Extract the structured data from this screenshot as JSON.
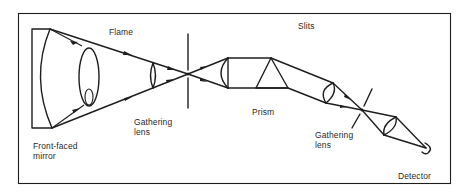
{
  "diagram": {
    "labels": {
      "flame": "Flame",
      "slits": "Slits",
      "gathering_lens_1": "Gathering\nlens",
      "prism": "Prism",
      "gathering_lens_2": "Gathering\nlens",
      "front_faced_mirror": "Front-faced\nmirror",
      "detector": "Detector"
    },
    "components": [
      "front-faced-mirror",
      "flame",
      "gathering-lens",
      "entrance-slit",
      "collimating-lens",
      "prism",
      "focusing-lens",
      "exit-slit",
      "gathering-lens",
      "detector"
    ],
    "colors": {
      "line": "#1e1e1e",
      "background": "#ffffff",
      "text": "#2a2a2a"
    }
  }
}
